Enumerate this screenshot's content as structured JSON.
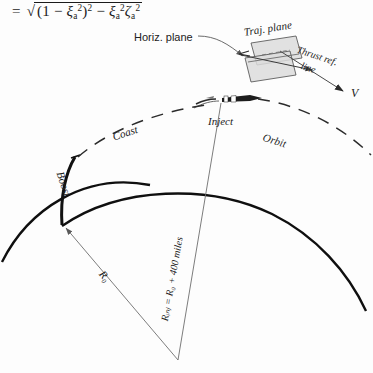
{
  "figure": {
    "title_equation": {
      "lhs": "=",
      "expression": "= √((1 − ξₐ²)² − ξₐ² ζₐ²)",
      "parts": {
        "equals": "=",
        "one": "1",
        "minus1": "−",
        "xi": "ξ",
        "sub_a": "a",
        "sup_2": "2",
        "minus2": "−",
        "zeta": "ζ"
      }
    },
    "inset": {
      "horiz_plane_label": "Horiz. plane",
      "traj_plane_label": "Traj. plane",
      "thrust_ref_line_label_1": "Thrust ref.",
      "thrust_ref_line_label_2": "line",
      "velocity_label": "V"
    },
    "trajectory": {
      "boost_label": "Boost",
      "coast_label": "Coast",
      "inject_label": "Inject",
      "orbit_label": "Orbit"
    },
    "radii": {
      "r_zero_label": "R₀",
      "r_inject_label": "Rᵢₙⱼ = R₀ + 400 miles",
      "r_inject_parts": {
        "symbol": "R",
        "subscript": "inj",
        "equals": "=",
        "base": "R",
        "base_sub": "0",
        "plus": "+",
        "distance": "400",
        "units": "miles"
      }
    },
    "colors": {
      "ink": "#1b1b1b",
      "thin_line": "#6e6e6e",
      "plane_fill": "#d8d8d8",
      "background": "#fdfdfd"
    }
  }
}
